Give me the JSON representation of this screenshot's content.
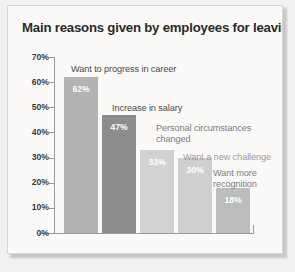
{
  "chart_data": {
    "type": "bar",
    "title": "Main reasons given by employees for leaving",
    "xlabel": "",
    "ylabel": "",
    "ylim": [
      0,
      70
    ],
    "ytick_labels": [
      "70%",
      "60%",
      "50%",
      "40%",
      "30%",
      "20%",
      "10%",
      "0%"
    ],
    "ytick_values": [
      70,
      60,
      50,
      40,
      30,
      20,
      10,
      0
    ],
    "grid": false,
    "legend": "none",
    "categories": [
      "Want to progress in career",
      "Increase in salary",
      "Personal circumstances changed",
      "Want a new challenge",
      "Want more recognition"
    ],
    "values": [
      62,
      47,
      33,
      30,
      18
    ],
    "value_labels": [
      "62%",
      "47%",
      "33%",
      "30%",
      "18%"
    ],
    "bar_colors": [
      "#b3b3b3",
      "#8d8d8d",
      "#d2d2d2",
      "#cfcfcf",
      "#bdbdbd"
    ],
    "annotations": [
      "Want to progress in career",
      "Increase in salary",
      "Personal circumstances\nchanged",
      "Want a new challenge",
      "Want more\nrecognition"
    ]
  },
  "figure": {
    "title": "Main reasons given by employees for leaving"
  }
}
